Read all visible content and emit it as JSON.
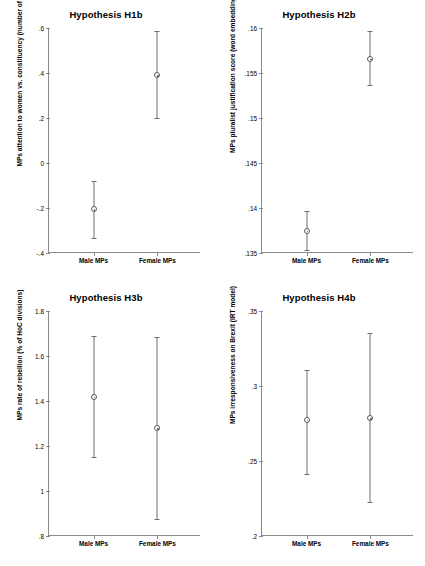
{
  "figure": {
    "width": 425,
    "height": 566,
    "background": "#ffffff",
    "marker_color": "#5a5a5a",
    "axis_color": "#8a8a8a"
  },
  "chart_data": [
    {
      "type": "scatter",
      "title": "Hypothesis H1b",
      "xlabel": "",
      "ylabel": "MPs attention to women vs. constituency (number of words)",
      "categories": [
        "Male MPs",
        "Female MPs"
      ],
      "values": [
        -0.205,
        0.39
      ],
      "ci_low": [
        -0.335,
        0.2
      ],
      "ci_high": [
        -0.082,
        0.585
      ],
      "ylim": [
        -0.4,
        0.6
      ],
      "yticks": [
        0.6,
        0.4,
        0.2,
        0,
        -0.2,
        -0.4
      ],
      "yticklabels": [
        ".6",
        ".4",
        ".2",
        "0",
        "-.2",
        "-.4"
      ],
      "grid": false,
      "legend": "none"
    },
    {
      "type": "scatter",
      "title": "Hypothesis H2b",
      "xlabel": "",
      "ylabel": "MPs pluralist justification score (word embeddings)",
      "categories": [
        "Male MPs",
        "Female MPs"
      ],
      "values": [
        0.1375,
        0.1566
      ],
      "ci_low": [
        0.1353,
        0.1537
      ],
      "ci_high": [
        0.1397,
        0.1597
      ],
      "ylim": [
        0.135,
        0.16
      ],
      "yticks": [
        0.16,
        0.155,
        0.15,
        0.145,
        0.14,
        0.135
      ],
      "yticklabels": [
        ".16",
        ".155",
        ".15",
        ".145",
        ".14",
        ".135"
      ],
      "grid": false,
      "legend": "none"
    },
    {
      "type": "scatter",
      "title": "Hypothesis H3b",
      "xlabel": "",
      "ylabel": "MPs rate of rebellion (% of HoC divisions)",
      "categories": [
        "Male MPs",
        "Female MPs"
      ],
      "values": [
        1.42,
        1.28
      ],
      "ci_low": [
        1.15,
        0.875
      ],
      "ci_high": [
        1.69,
        1.685
      ],
      "ylim": [
        0.8,
        1.8
      ],
      "yticks": [
        1.8,
        1.6,
        1.4,
        1.2,
        1.0,
        0.8
      ],
      "yticklabels": [
        "1.8",
        "1.6",
        "1.4",
        "1.2",
        "1",
        ".8"
      ],
      "grid": false,
      "legend": "none"
    },
    {
      "type": "scatter",
      "title": "Hypothesis H4b",
      "xlabel": "",
      "ylabel": "MPs irresponsiveness on Brexit (IRT model)",
      "categories": [
        "Male MPs",
        "Female MPs"
      ],
      "values": [
        0.2775,
        0.2785
      ],
      "ci_low": [
        0.2415,
        0.2225
      ],
      "ci_high": [
        0.3105,
        0.3355
      ],
      "ylim": [
        0.2,
        0.35
      ],
      "yticks": [
        0.35,
        0.3,
        0.25,
        0.2
      ],
      "yticklabels": [
        ".35",
        ".3",
        ".25",
        ".2"
      ],
      "grid": false,
      "legend": "none"
    }
  ]
}
